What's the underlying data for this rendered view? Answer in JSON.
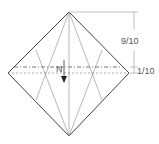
{
  "diagram": {
    "type": "origami-fold-diagram",
    "measurements": {
      "upper": "9/10",
      "lower": "1/10"
    },
    "fold_label": "N",
    "colors": {
      "outline": "#444444",
      "crease": "#888888",
      "background": "#ffffff"
    }
  }
}
